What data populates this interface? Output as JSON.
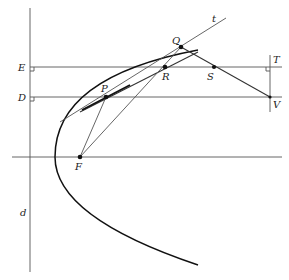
{
  "diagram": {
    "type": "geometric construction: parabola with focus, directrix and tangent",
    "background": "#ffffff",
    "stroke_color": "#222222",
    "labels": {
      "E": "E",
      "D": "D",
      "P": "P",
      "Q": "Q",
      "R": "R",
      "S": "S",
      "T": "T",
      "V": "V",
      "F": "F",
      "d": "d",
      "t": "t"
    },
    "points": {
      "P": [
        106,
        97
      ],
      "Q": [
        181,
        47
      ],
      "R": [
        165,
        67
      ],
      "S": [
        214,
        67
      ],
      "V": [
        270,
        97
      ],
      "F": [
        80,
        157
      ]
    },
    "lines": [
      {
        "name": "directrix-d",
        "from": [
          30,
          8
        ],
        "to": [
          30,
          272
        ]
      },
      {
        "name": "line-E",
        "from": [
          30,
          67
        ],
        "to": [
          282,
          67
        ]
      },
      {
        "name": "line-D",
        "from": [
          30,
          97
        ],
        "to": [
          282,
          97
        ]
      },
      {
        "name": "axis",
        "from": [
          12,
          157
        ],
        "to": [
          282,
          157
        ]
      },
      {
        "name": "line-TV",
        "from": [
          270,
          55
        ],
        "to": [
          270,
          112
        ]
      },
      {
        "name": "line-t",
        "from": [
          60,
          122
        ],
        "to": [
          226,
          18
        ]
      },
      {
        "name": "tangent-at-P",
        "from": [
          80,
          113
        ],
        "to": [
          198,
          52
        ]
      },
      {
        "name": "segment-FP",
        "from": [
          80,
          157
        ],
        "to": [
          106,
          97
        ]
      },
      {
        "name": "segment-FQ",
        "from": [
          80,
          157
        ],
        "to": [
          181,
          47
        ]
      },
      {
        "name": "segment-QV",
        "from": [
          181,
          47
        ],
        "to": [
          270,
          97
        ]
      }
    ],
    "parabola": {
      "vertex": [
        55,
        157
      ],
      "focus": "F",
      "directrix": "d"
    }
  }
}
